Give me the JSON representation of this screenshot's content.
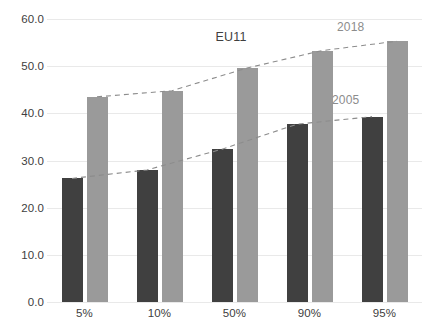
{
  "chart_data": {
    "type": "bar",
    "title": "EU11",
    "xlabel": "",
    "ylabel": "",
    "categories": [
      "5%",
      "10%",
      "50%",
      "90%",
      "95%"
    ],
    "series": [
      {
        "name": "2005",
        "color": "#404040",
        "values": [
          26.2,
          28.0,
          32.4,
          37.7,
          39.3
        ]
      },
      {
        "name": "2018",
        "color": "#9a9a9a",
        "values": [
          43.5,
          44.8,
          49.6,
          53.3,
          55.3
        ]
      }
    ],
    "ylim": [
      0,
      60
    ],
    "yticks": [
      "0.0",
      "10.0",
      "20.0",
      "30.0",
      "40.0",
      "50.0",
      "60.0"
    ],
    "ytick_values": [
      0,
      10,
      20,
      30,
      40,
      50,
      60
    ],
    "grid": true,
    "legend": "none",
    "annotations": [
      {
        "text": "2018",
        "series": "2018",
        "color": "#8c8c8c"
      },
      {
        "text": "2005",
        "series": "2005",
        "color": "#8c8c8c"
      }
    ],
    "trend_lines": [
      {
        "name": "2018",
        "style": "dashed",
        "color": "#8c8c8c"
      },
      {
        "name": "2005",
        "style": "dashed",
        "color": "#8c8c8c"
      }
    ],
    "background": "#ffffff",
    "gridline_color": "#e9e9e9"
  }
}
